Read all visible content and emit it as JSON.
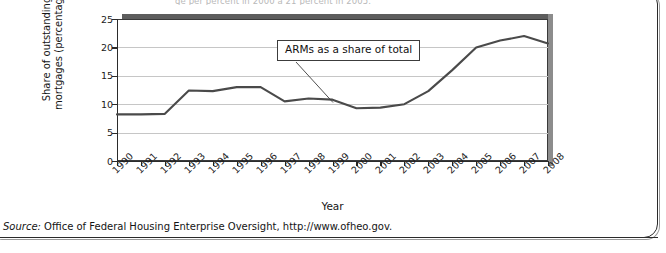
{
  "figure": {
    "top_clipped_caption": "ge per                  percent in 2000 a 21 percent in 2005.",
    "source_label": "Source:",
    "source_text": " Office of Federal Housing Enterprise Oversight, http://www.ofheo.gov.",
    "annotation": "ARMs as a share of total"
  },
  "chart_data": {
    "type": "line",
    "title": "",
    "xlabel": "Year",
    "ylabel": "Share of outstanding\nmortgages (percentage)",
    "categories": [
      "1990",
      "1991",
      "1992",
      "1993",
      "1994",
      "1995",
      "1996",
      "1997",
      "1998",
      "1999",
      "2000",
      "2001",
      "2002",
      "2003",
      "2004",
      "2005",
      "2006",
      "2007",
      "2008"
    ],
    "values": [
      8.2,
      8.2,
      8.3,
      12.4,
      12.3,
      13.0,
      13.0,
      10.5,
      11.0,
      10.8,
      9.3,
      9.4,
      10.0,
      12.3,
      16.0,
      20.0,
      21.2,
      22.0,
      20.7
    ],
    "series": [
      {
        "name": "ARMs as a share of total",
        "values": [
          8.2,
          8.2,
          8.3,
          12.4,
          12.3,
          13.0,
          13.0,
          10.5,
          11.0,
          10.8,
          9.3,
          9.4,
          10.0,
          12.3,
          16.0,
          20.0,
          21.2,
          22.0,
          20.7
        ]
      }
    ],
    "ylim": [
      0,
      25
    ],
    "yticks": [
      0,
      5,
      10,
      15,
      20,
      25
    ],
    "ytick_labels": [
      "0",
      "5",
      "10",
      "15",
      "20",
      "25"
    ],
    "xlim": [
      "1990",
      "2008"
    ],
    "grid": true,
    "legend": "none",
    "line_color": "#4a4a4a",
    "grid_color": "#c6c6c6",
    "annotations": [
      {
        "text": "ARMs as a share of total",
        "points_to_year": "1999",
        "points_to_value": 10.8
      }
    ]
  }
}
